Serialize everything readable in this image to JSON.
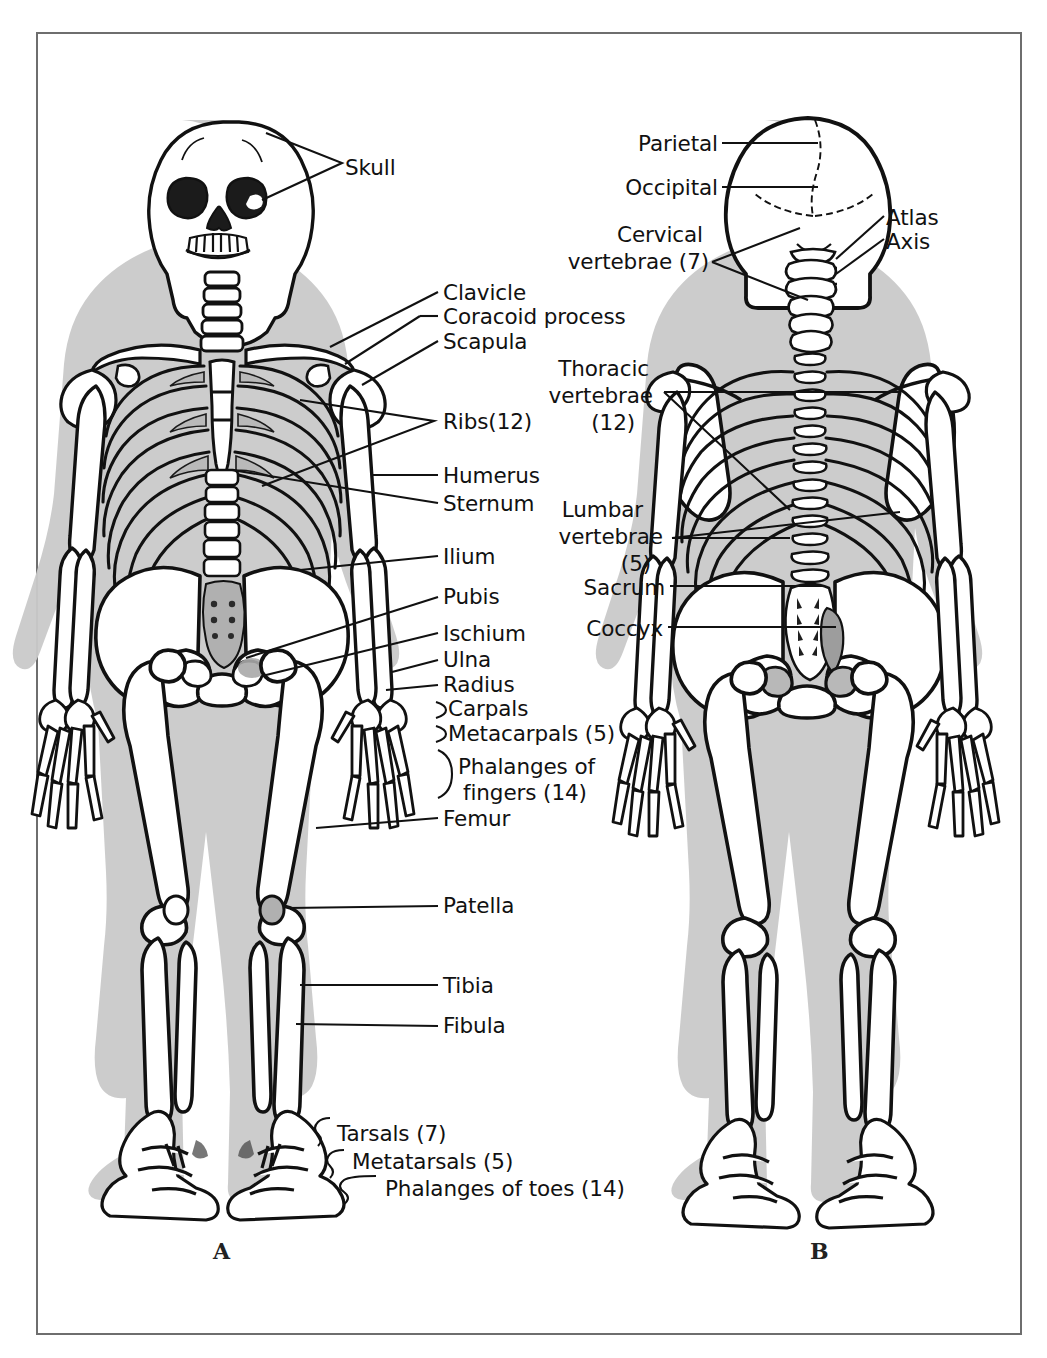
{
  "figure": {
    "panels": [
      {
        "id": "A",
        "label": "A",
        "view": "anterior",
        "x": 218,
        "y": 1252
      },
      {
        "id": "B",
        "label": "B",
        "view": "posterior",
        "x": 815,
        "y": 1252
      }
    ],
    "frame_color": "#6e6e6e",
    "bone_outline_color": "#111111",
    "body_shadow_color": "#c9c9c9",
    "background_color": "#ffffff"
  },
  "labels_anterior": [
    {
      "id": "skull",
      "text": "Skull",
      "x": 345,
      "y": 155,
      "align": "left"
    },
    {
      "id": "clavicle",
      "text": "Clavicle",
      "x": 443,
      "y": 298,
      "align": "left"
    },
    {
      "id": "coracoid-process",
      "text": "Coracoid process",
      "x": 443,
      "y": 322,
      "align": "left"
    },
    {
      "id": "scapula",
      "text": "Scapula",
      "x": 443,
      "y": 347,
      "align": "left"
    },
    {
      "id": "ribs",
      "text": "Ribs(12)",
      "x": 443,
      "y": 427,
      "align": "left"
    },
    {
      "id": "humerus",
      "text": "Humerus",
      "x": 443,
      "y": 481,
      "align": "left"
    },
    {
      "id": "sternum",
      "text": "Sternum",
      "x": 443,
      "y": 509,
      "align": "left"
    },
    {
      "id": "ilium",
      "text": "Ilium",
      "x": 443,
      "y": 562,
      "align": "left"
    },
    {
      "id": "pubis",
      "text": "Pubis",
      "x": 443,
      "y": 602,
      "align": "left"
    },
    {
      "id": "ischium",
      "text": "Ischium",
      "x": 443,
      "y": 639,
      "align": "left"
    },
    {
      "id": "ulna",
      "text": "Ulna",
      "x": 443,
      "y": 665,
      "align": "left"
    },
    {
      "id": "radius",
      "text": "Radius",
      "x": 443,
      "y": 690,
      "align": "left"
    },
    {
      "id": "carpals",
      "text": "Carpals",
      "x": 448,
      "y": 714,
      "align": "left"
    },
    {
      "id": "metacarpals",
      "text": "Metacarpals (5)",
      "x": 448,
      "y": 739,
      "align": "left"
    },
    {
      "id": "phalanges-fingers-1",
      "text": "Phalanges of",
      "x": 458,
      "y": 772,
      "align": "left"
    },
    {
      "id": "phalanges-fingers-2",
      "text": "fingers (14)",
      "x": 463,
      "y": 798,
      "align": "left"
    },
    {
      "id": "femur",
      "text": "Femur",
      "x": 443,
      "y": 824,
      "align": "left"
    },
    {
      "id": "patella",
      "text": "Patella",
      "x": 443,
      "y": 911,
      "align": "left"
    },
    {
      "id": "tibia",
      "text": "Tibia",
      "x": 443,
      "y": 991,
      "align": "left"
    },
    {
      "id": "fibula",
      "text": "Fibula",
      "x": 443,
      "y": 1031,
      "align": "left"
    },
    {
      "id": "tarsals",
      "text": "Tarsals (7)",
      "x": 337,
      "y": 1139,
      "align": "left"
    },
    {
      "id": "metatarsals",
      "text": "Metatarsals (5)",
      "x": 352,
      "y": 1167,
      "align": "left"
    },
    {
      "id": "phalanges-toes",
      "text": "Phalanges of toes (14)",
      "x": 385,
      "y": 1194,
      "align": "left"
    }
  ],
  "labels_posterior": [
    {
      "id": "parietal",
      "text": "Parietal",
      "x": 715,
      "y": 143,
      "align": "right"
    },
    {
      "id": "occipital",
      "text": "Occipital",
      "x": 715,
      "y": 186,
      "align": "right"
    },
    {
      "id": "atlas",
      "text": "Atlas",
      "x": 886,
      "y": 217,
      "align": "left"
    },
    {
      "id": "axis",
      "text": "Axis",
      "x": 886,
      "y": 241,
      "align": "left"
    },
    {
      "id": "cervical-1",
      "text": "Cervical",
      "x": 700,
      "y": 233,
      "align": "right"
    },
    {
      "id": "cervical-2",
      "text": "vertebrae (7)",
      "x": 706,
      "y": 260,
      "align": "right"
    },
    {
      "id": "thoracic-1",
      "text": "Thoracic",
      "x": 646,
      "y": 368,
      "align": "right"
    },
    {
      "id": "thoracic-2",
      "text": "vertebrae",
      "x": 650,
      "y": 395,
      "align": "right"
    },
    {
      "id": "thoracic-3",
      "text": "(12)",
      "x": 632,
      "y": 422,
      "align": "right"
    },
    {
      "id": "lumbar-1",
      "text": "Lumbar",
      "x": 640,
      "y": 509,
      "align": "right"
    },
    {
      "id": "lumbar-2",
      "text": "vertebrae",
      "x": 660,
      "y": 536,
      "align": "right"
    },
    {
      "id": "lumbar-3",
      "text": "(5)",
      "x": 648,
      "y": 563,
      "align": "right"
    },
    {
      "id": "sacrum",
      "text": "Sacrum",
      "x": 662,
      "y": 591,
      "align": "right"
    },
    {
      "id": "coccyx",
      "text": "Coccyx",
      "x": 660,
      "y": 632,
      "align": "right"
    }
  ],
  "leader_lines": {
    "style": "thin black straight lines with brace marks for grouped structures",
    "color": "#111111"
  }
}
